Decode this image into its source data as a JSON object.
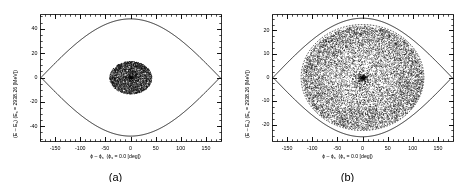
{
  "figure": {
    "background": "#ffffff",
    "ink": "#000000",
    "panels": [
      {
        "id": "a",
        "caption": "(a)",
        "plot": {
          "xlabel_parts": {
            "phi": "ϕ",
            "minus": " - ",
            "phi_s": "ϕ",
            "sub_s": "s",
            "paren": "  (",
            "phi_s2": "ϕ",
            "sub_s2": "s",
            "eq": " = 0.0 [deg])"
          },
          "xlabel": "ϕ - ϕs  (ϕs = 0.0 [deg])",
          "ylabel": "(E - Es) (Es = 2938.26 [MeV])",
          "xlim": [
            -180,
            180
          ],
          "ylim": [
            -52,
            52
          ],
          "xticks": [
            -150,
            -100,
            -50,
            0,
            50,
            100,
            150
          ],
          "yticks": [
            40,
            20,
            0,
            -20,
            -40
          ],
          "xminor_step": 10,
          "yminor_step": 5,
          "separatrix_height": 48.0,
          "separatrix_width": 178.0,
          "inner_contour": false,
          "bunch": {
            "shape": "round",
            "x_radius": 42,
            "y_radius": 13.5,
            "n_points": 4200,
            "center": [
              0,
              0
            ],
            "core_density": 2.1
          }
        }
      },
      {
        "id": "b",
        "caption": "(b)",
        "plot": {
          "xlabel": "ϕ - ϕs  (ϕs = 0.0 [deg])",
          "ylabel": "(E - Es) (Es = 2938.26 [MeV])",
          "xlim": [
            -180,
            180
          ],
          "ylim": [
            -27,
            27
          ],
          "xticks": [
            -150,
            -100,
            -50,
            0,
            50,
            100,
            150
          ],
          "yticks": [
            20,
            10,
            0,
            -10,
            -20
          ],
          "xminor_step": 10,
          "yminor_step": 2.5,
          "separatrix_height": 25.2,
          "separatrix_width": 178.0,
          "inner_contour": true,
          "inner_contour_style": "dashed",
          "inner_contour_rx": 122,
          "inner_contour_ry": 22.5,
          "bunch": {
            "shape": "filled-ellipse",
            "x_radius": 120,
            "y_radius": 22.0,
            "n_points": 11000,
            "center": [
              0,
              0
            ],
            "core_density": 2.6
          }
        }
      }
    ],
    "chart_data": {
      "type": "scatter",
      "title": "",
      "panels": [
        {
          "label": "(a)",
          "xlabel": "ϕ - ϕs  (ϕs = 0.0 [deg])",
          "ylabel": "(E - Es) (Es = 2938.26 [MeV])",
          "xlim": [
            -180,
            180
          ],
          "ylim": [
            -52,
            52
          ],
          "xticks": [
            -150,
            -100,
            -50,
            0,
            50,
            100,
            150
          ],
          "yticks": [
            -40,
            -20,
            0,
            20,
            40
          ],
          "series": [
            {
              "name": "separatrix",
              "type": "line",
              "description": "RF bucket boundary, lens/eye shaped, half-height 48 at phi=0, vertices at phi=-178 and +178"
            },
            {
              "name": "beam particles",
              "type": "scatter",
              "n": 4200,
              "extent_x": [
                -42,
                42
              ],
              "extent_y": [
                -13.5,
                13.5
              ],
              "description": "compact round bunch concentrated at bucket center, dense core"
            }
          ],
          "grid": false,
          "legend": "none"
        },
        {
          "label": "(b)",
          "xlabel": "ϕ - ϕs  (ϕs = 0.0 [deg])",
          "ylabel": "(E - Es) (Es = 2938.26 [MeV])",
          "xlim": [
            -180,
            180
          ],
          "ylim": [
            -27,
            27
          ],
          "xticks": [
            -150,
            -100,
            -50,
            0,
            50,
            100,
            150
          ],
          "yticks": [
            -20,
            -10,
            0,
            10,
            20
          ],
          "series": [
            {
              "name": "separatrix",
              "type": "line",
              "description": "RF bucket boundary, lens/eye shaped, half-height 25.2 at phi=0, vertices at phi=-178 and +178"
            },
            {
              "name": "inner contour",
              "type": "dashed-line",
              "rx": 122,
              "ry": 22.5,
              "description": "dashed elliptical contour enclosing the particle distribution"
            },
            {
              "name": "beam particles",
              "type": "scatter",
              "n": 11000,
              "extent_x": [
                -120,
                120
              ],
              "extent_y": [
                -22,
                22
              ],
              "description": "filamented bunch filling most of the bucket, dense core at origin"
            }
          ],
          "grid": false,
          "legend": "none"
        }
      ]
    }
  }
}
